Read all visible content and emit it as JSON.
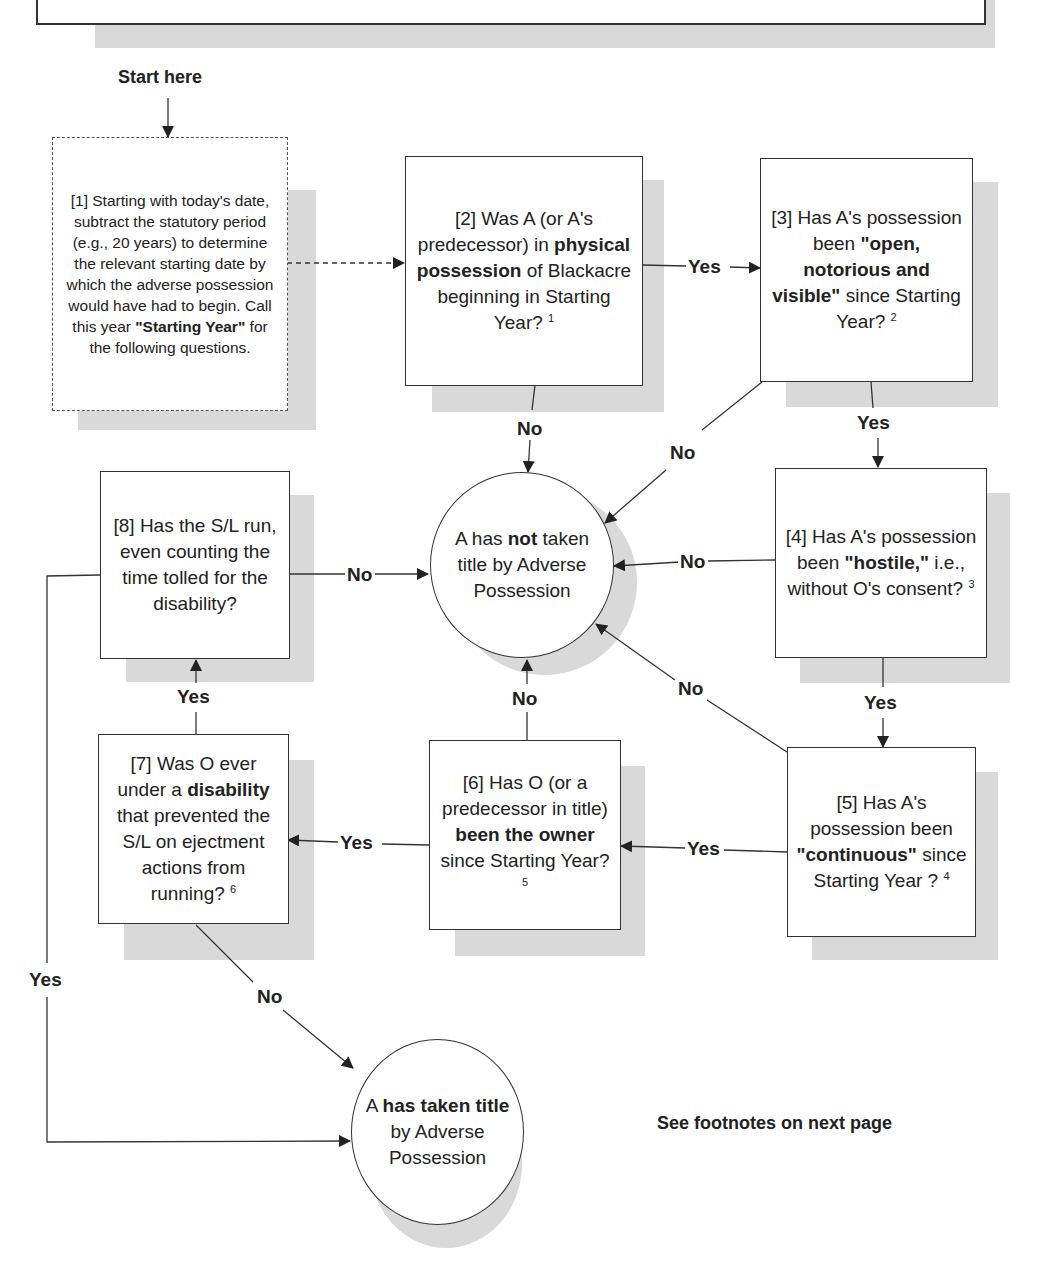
{
  "header": {
    "start_label": "Start here"
  },
  "nodes": {
    "n1": {
      "id": "[1]",
      "parts": [
        "[1] Starting with today's date, subtract the statutory period (e.g., 20 years) to determine the relevant starting date by which the adverse possession would have had to begin. Call this year ",
        "\"Starting Year\"",
        " for the following questions."
      ]
    },
    "n2": {
      "parts": [
        "[2] Was A (or A's predecessor) in ",
        "physical possession",
        " of Blackacre beginning in Starting Year? ",
        "1"
      ]
    },
    "n3": {
      "parts": [
        "[3] Has A's possession been ",
        "\"open, notorious and visible\"",
        " since Starting Year? ",
        "2"
      ]
    },
    "n4": {
      "parts": [
        "[4] Has A's possession been ",
        "\"hostile,\"",
        " i.e., without O's consent? ",
        "3"
      ]
    },
    "n5": {
      "parts": [
        "[5] Has A's possession been ",
        "\"continuous\"",
        " since Starting Year ? ",
        "4"
      ]
    },
    "n6": {
      "parts": [
        "[6] Has O (or a predecessor in title) ",
        "been the owner",
        " since Starting Year? ",
        "5"
      ]
    },
    "n7": {
      "parts": [
        "[7] Was O ever under a ",
        "disability",
        " that prevented the S/L on ejectment actions from running? ",
        "6"
      ]
    },
    "n8": {
      "parts": [
        "[8] Has the S/L run, even counting the time tolled for the disability?"
      ]
    },
    "not_taken": {
      "parts": [
        "A has ",
        "not",
        " taken title by Adverse Possession"
      ]
    },
    "taken": {
      "parts": [
        "A ",
        "has taken title",
        " by Adverse Possession"
      ]
    }
  },
  "edges": {
    "yes": "Yes",
    "no": "No"
  },
  "footer": {
    "note": "See footnotes on next page"
  },
  "colors": {
    "line": "#333333",
    "shadow": "#d9d9d9",
    "background": "#ffffff"
  }
}
